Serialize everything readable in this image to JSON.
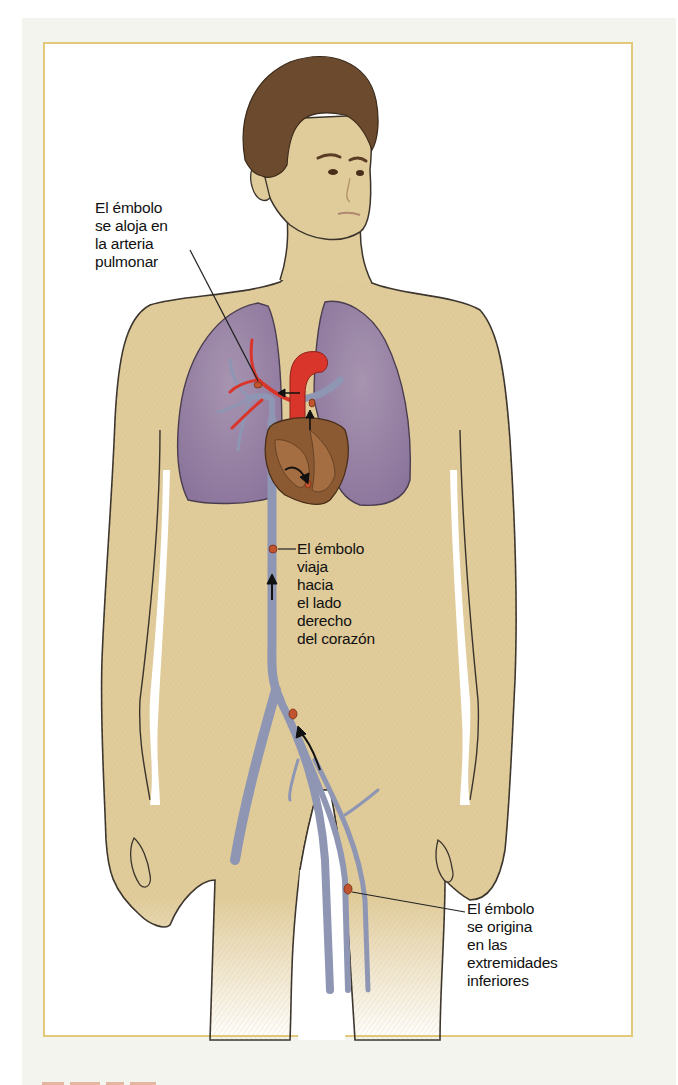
{
  "figure": {
    "colors": {
      "panel_background": "#f3f4ee",
      "frame_border": "#e2c979",
      "skin": "#e0cb9a",
      "skin_outline": "#3a342c",
      "hair": "#6b4a2e",
      "lungs": "#9c87a8",
      "veins": "#8e96b4",
      "artery": "#d9352a",
      "heart": "#8b5a33",
      "embolus": "#c0542e",
      "label_text": "#111111"
    },
    "labels": {
      "lodges": "El émbolo\nse aloja en\nla arteria\npulmonar",
      "travels": "El émbolo\nviaja\nhacia\nel lado\nderecho\ndel corazón",
      "origin": "El émbolo\nse origina\nen las\nextremidades\n inferiores"
    },
    "icons": {
      "arrow_leg": "flow-arrow-up",
      "arrow_vena_cava": "flow-arrow-up",
      "arrow_heart": "flow-arrow-curved",
      "arrow_pulmonary": "flow-arrow-up"
    }
  }
}
